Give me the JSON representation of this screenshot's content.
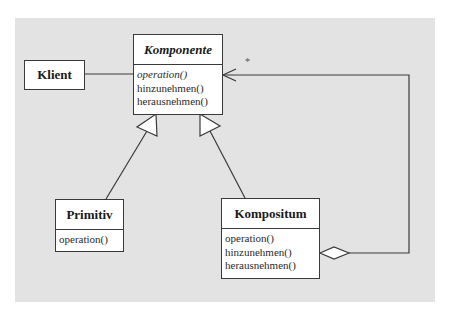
{
  "diagram": {
    "type": "UML class diagram",
    "pattern": "Kompositum (Composite)",
    "colors": {
      "panel_background": "#e3e3e3",
      "box_fill": "#ffffff",
      "line": "#3a3a3a"
    },
    "classes": {
      "klient": {
        "name": "Klient",
        "abstract": false,
        "operations": []
      },
      "komponente": {
        "name": "Komponente",
        "abstract": true,
        "operations": [
          {
            "label": "operation()",
            "abstract": true
          },
          {
            "label": "hinzunehmen()",
            "abstract": false
          },
          {
            "label": "herausnehmen()",
            "abstract": false
          }
        ]
      },
      "primitiv": {
        "name": "Primitiv",
        "abstract": false,
        "operations": [
          {
            "label": "operation()",
            "abstract": false
          }
        ]
      },
      "kompositum": {
        "name": "Kompositum",
        "abstract": false,
        "operations": [
          {
            "label": "operation()",
            "abstract": false
          },
          {
            "label": "hinzunehmen()",
            "abstract": false
          },
          {
            "label": "herausnehmen()",
            "abstract": false
          }
        ]
      }
    },
    "relations": [
      {
        "type": "association",
        "from": "Klient",
        "to": "Komponente"
      },
      {
        "type": "generalization",
        "from": "Primitiv",
        "to": "Komponente"
      },
      {
        "type": "generalization",
        "from": "Kompositum",
        "to": "Komponente"
      },
      {
        "type": "aggregation",
        "from": "Kompositum",
        "to": "Komponente",
        "multiplicity": "*"
      }
    ],
    "multiplicity_label": "*"
  }
}
